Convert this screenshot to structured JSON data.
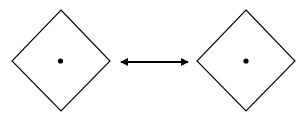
{
  "diagram": {
    "nodes": [
      {
        "id": "left",
        "shape": "diamond",
        "label": "",
        "has_center_dot": true
      },
      {
        "id": "right",
        "shape": "diamond",
        "label": "",
        "has_center_dot": true
      }
    ],
    "edges": [
      {
        "from": "left",
        "to": "right",
        "type": "bidirectional-arrow",
        "label": ""
      }
    ],
    "colors": {
      "stroke": "#000000",
      "background": "#ffffff"
    }
  }
}
